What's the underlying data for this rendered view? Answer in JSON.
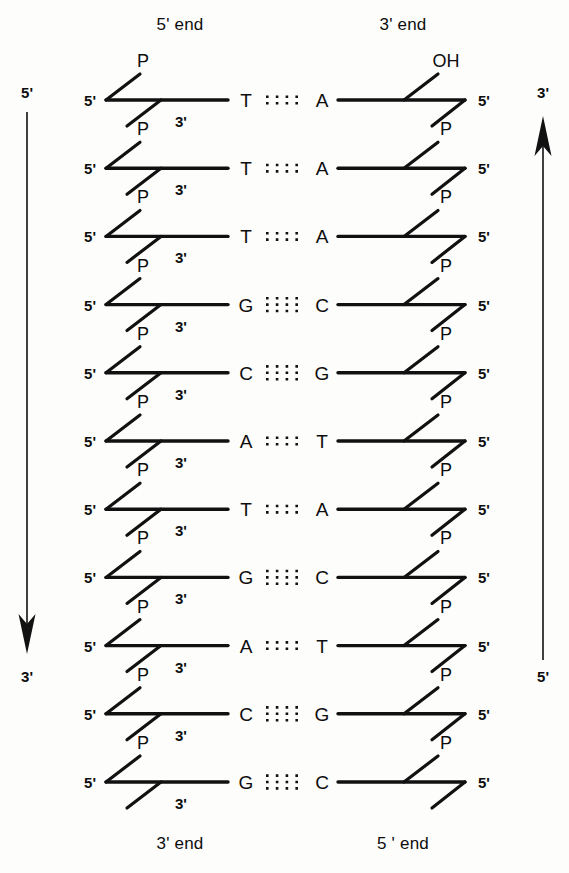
{
  "figure": {
    "background_color": "#fdfdfc",
    "ink_color": "#111111",
    "width": 569,
    "height": 873
  },
  "headers": {
    "left_top": "5' end",
    "right_top": "3' end",
    "left_bottom": "3' end",
    "right_bottom": "5 ' end"
  },
  "direction_arrows": {
    "left": {
      "name": "left-strand-direction-arrow",
      "top_label": "5'",
      "bottom_label": "3'",
      "points": "down"
    },
    "right": {
      "name": "right-strand-direction-arrow",
      "top_label": "3'",
      "bottom_label": "5'",
      "points": "up"
    }
  },
  "nucleotide_labels": {
    "five_prime": "5'",
    "three_prime": "3'",
    "phosphate": "P",
    "hydroxyl": "OH"
  },
  "chart_data": {
    "type": "diagram",
    "strand_count": 2,
    "base_pair_count": 11,
    "base_pairs": [
      {
        "index": 1,
        "left": "T",
        "right": "A",
        "bonds": 2
      },
      {
        "index": 2,
        "left": "T",
        "right": "A",
        "bonds": 2
      },
      {
        "index": 3,
        "left": "T",
        "right": "A",
        "bonds": 2
      },
      {
        "index": 4,
        "left": "G",
        "right": "C",
        "bonds": 3
      },
      {
        "index": 5,
        "left": "C",
        "right": "G",
        "bonds": 3
      },
      {
        "index": 6,
        "left": "A",
        "right": "T",
        "bonds": 2
      },
      {
        "index": 7,
        "left": "T",
        "right": "A",
        "bonds": 2
      },
      {
        "index": 8,
        "left": "G",
        "right": "C",
        "bonds": 3
      },
      {
        "index": 9,
        "left": "A",
        "right": "T",
        "bonds": 2
      },
      {
        "index": 10,
        "left": "C",
        "right": "G",
        "bonds": 3
      },
      {
        "index": 11,
        "left": "G",
        "right": "C",
        "bonds": 3
      }
    ],
    "left_strand": {
      "sequence_5_to_3": "TTTGCATGACG",
      "five_prime_end": "top",
      "three_prime_end": "bottom",
      "terminal_group_top": "P",
      "terminal_group_bottom": "3'"
    },
    "right_strand": {
      "sequence_3_to_5_top_to_bottom": "AAACGTACTGC",
      "three_prime_end": "top",
      "five_prime_end": "bottom",
      "terminal_group_top": "OH"
    }
  }
}
